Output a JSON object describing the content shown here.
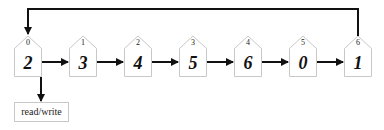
{
  "nodes": [
    {
      "index": "0",
      "value": "2"
    },
    {
      "index": "1",
      "value": "3"
    },
    {
      "index": "2",
      "value": "4"
    },
    {
      "index": "3",
      "value": "5"
    },
    {
      "index": "4",
      "value": "6"
    },
    {
      "index": "5",
      "value": "0"
    },
    {
      "index": "6",
      "value": "1"
    }
  ],
  "read_write_label": "read/write"
}
